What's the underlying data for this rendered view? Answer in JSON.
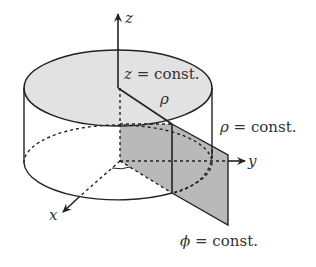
{
  "diagram": {
    "axes": {
      "z_label": "z",
      "y_label": "y",
      "x_label": "x"
    },
    "labels": {
      "z_surface_var": "z",
      "z_surface_rest": " = const.",
      "rho_radius": "ρ",
      "rho_surface_var": "ρ",
      "rho_surface_rest": " = const.",
      "phi_surface_var": "ϕ",
      "phi_surface_rest": " = const."
    },
    "colors": {
      "line": "#222222",
      "top_disk_fill": "#e2e2e2",
      "phi_plane_fill": "#b9b9b9",
      "text": "#333333"
    }
  }
}
